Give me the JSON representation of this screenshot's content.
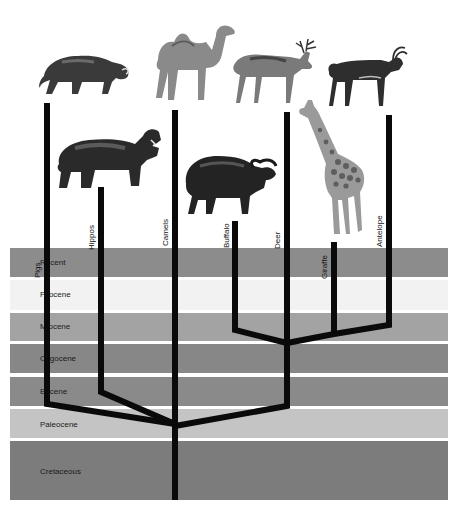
{
  "diagram": {
    "type": "phylogenetic-tree",
    "topic": "Evolution of even-toed ungulates across geological epochs",
    "epochs": [
      {
        "name": "Recent",
        "color": "#8c8c8c"
      },
      {
        "name": "Pliocene",
        "color": "#f2f2f2"
      },
      {
        "name": "Miocene",
        "color": "#a3a3a3"
      },
      {
        "name": "Oligocene",
        "color": "#878787"
      },
      {
        "name": "Eocene",
        "color": "#8a8a8a"
      },
      {
        "name": "Paleocene",
        "color": "#c4c4c4"
      },
      {
        "name": "Cretaceous",
        "color": "#7c7c7c"
      }
    ],
    "taxa": [
      {
        "name": "Pigs",
        "animal": "warthog"
      },
      {
        "name": "Hippos",
        "animal": "hippopotamus"
      },
      {
        "name": "Camels",
        "animal": "camel"
      },
      {
        "name": "Buffalo",
        "animal": "cape-buffalo"
      },
      {
        "name": "Deer",
        "animal": "stag"
      },
      {
        "name": "Giraffe",
        "animal": "giraffe"
      },
      {
        "name": "Antelope",
        "animal": "sable-antelope"
      }
    ],
    "colors": {
      "background": "#ffffff",
      "branch": "#0a0a0a",
      "band_separator": "#ffffff"
    }
  }
}
